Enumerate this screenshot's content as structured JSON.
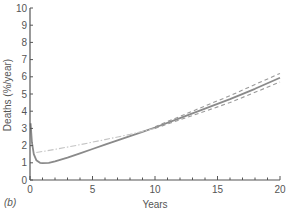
{
  "panel_label": "(b)",
  "chart_data": {
    "type": "line",
    "title": "",
    "xlabel": "Years",
    "ylabel": "Deaths (%/year)",
    "xlim": [
      0,
      20
    ],
    "ylim": [
      0,
      10
    ],
    "x_ticks": [
      0,
      5,
      10,
      15,
      20
    ],
    "y_ticks": [
      0,
      1,
      2,
      3,
      4,
      5,
      6,
      7,
      8,
      9,
      10
    ],
    "grid": false,
    "legend": null,
    "series": [
      {
        "name": "hazard estimate",
        "style": "solid",
        "x": [
          0.05,
          0.15,
          0.3,
          0.5,
          0.8,
          1.0,
          1.5,
          2,
          3,
          4,
          5,
          6,
          7,
          8,
          9,
          10,
          12,
          14,
          16,
          18,
          20
        ],
        "y": [
          3.3,
          2.2,
          1.5,
          1.15,
          1.0,
          0.98,
          1.0,
          1.08,
          1.3,
          1.55,
          1.8,
          2.05,
          2.3,
          2.55,
          2.8,
          3.05,
          3.6,
          4.15,
          4.7,
          5.3,
          5.95
        ]
      },
      {
        "name": "upper confidence limit",
        "style": "dashed",
        "x": [
          10,
          12,
          14,
          16,
          18,
          20
        ],
        "y": [
          3.1,
          3.7,
          4.3,
          4.9,
          5.55,
          6.2
        ]
      },
      {
        "name": "lower confidence limit",
        "style": "dashed",
        "x": [
          10,
          12,
          14,
          16,
          18,
          20
        ],
        "y": [
          3.0,
          3.5,
          4.0,
          4.5,
          5.1,
          5.7
        ]
      },
      {
        "name": "late-phase extrapolation",
        "style": "dash-dot",
        "x": [
          0.5,
          2,
          4,
          6,
          8,
          10
        ],
        "y": [
          1.6,
          1.78,
          2.05,
          2.35,
          2.65,
          3.0
        ]
      }
    ]
  },
  "colors": {
    "axis": "#555555",
    "solid_line": "#8a8a8a",
    "dashed_line": "#9a9a9a",
    "dashdot_line": "#c4c4c4"
  }
}
